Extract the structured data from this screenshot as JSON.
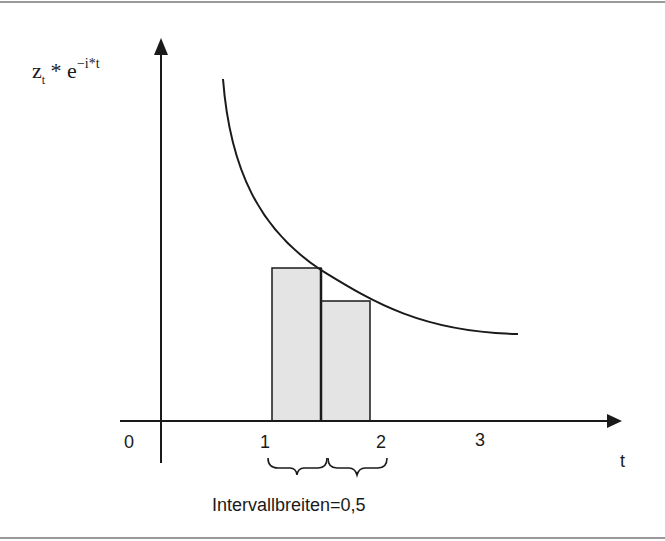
{
  "diagram": {
    "y_axis_label": {
      "base": "z",
      "subscript": "t",
      "operator": " * e",
      "exponent": "−i*t"
    },
    "x_axis_label": "t",
    "x_ticks": [
      {
        "value": 0,
        "label": "0"
      },
      {
        "value": 1,
        "label": "1"
      },
      {
        "value": 2,
        "label": "2"
      },
      {
        "value": 3,
        "label": "3"
      }
    ],
    "bars": [
      {
        "t_start": 1.0,
        "t_end": 1.5,
        "relative_height": 0.5
      },
      {
        "t_start": 1.5,
        "t_end": 2.0,
        "relative_height": 0.38
      }
    ],
    "brace_label": "Intervallbreiten=0,5",
    "colors": {
      "line": "#1a1a1a",
      "bar_fill": "#e4e4e4",
      "border": "#9a9a9a"
    }
  }
}
